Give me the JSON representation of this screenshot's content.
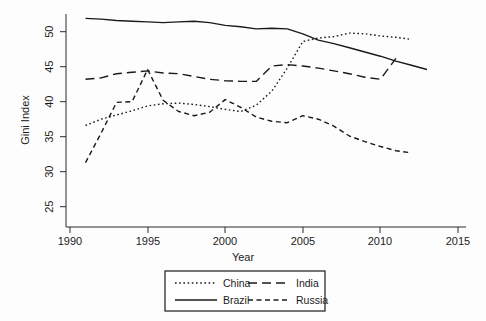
{
  "chart_data": {
    "type": "line",
    "title": "",
    "xlabel": "Year",
    "ylabel": "Gini Index",
    "xlim": [
      1990,
      2015
    ],
    "ylim": [
      25,
      52.5
    ],
    "xticks": [
      1990,
      1995,
      2000,
      2005,
      2010,
      2015
    ],
    "yticks": [
      25,
      30,
      35,
      40,
      45,
      50
    ],
    "grid": false,
    "legend_position": "below-axes",
    "series": [
      {
        "name": "China",
        "style": "dotted",
        "x": [
          1991,
          1992,
          1993,
          1994,
          1995,
          1996,
          1997,
          1998,
          1999,
          2000,
          2001,
          2002,
          2003,
          2004,
          2005,
          2006,
          2007,
          2008,
          2009,
          2010,
          2011,
          2012
        ],
        "values": [
          36.6,
          37.5,
          38.1,
          38.7,
          39.4,
          39.7,
          39.8,
          39.6,
          39.3,
          38.9,
          38.6,
          39.5,
          41.5,
          44.8,
          48.6,
          49.1,
          49.3,
          49.8,
          49.7,
          49.4,
          49.2,
          48.9
        ]
      },
      {
        "name": "Brazil",
        "style": "solid",
        "x": [
          1991,
          1992,
          1993,
          1994,
          1995,
          1996,
          1997,
          1998,
          1999,
          2000,
          2001,
          2002,
          2003,
          2004,
          2005,
          2006,
          2007,
          2008,
          2009,
          2010,
          2011,
          2012,
          2013
        ],
        "values": [
          51.9,
          51.8,
          51.6,
          51.5,
          51.4,
          51.3,
          51.4,
          51.5,
          51.3,
          50.9,
          50.7,
          50.4,
          50.5,
          50.4,
          49.7,
          48.8,
          48.3,
          47.7,
          47.1,
          46.5,
          45.8,
          45.2,
          44.6
        ]
      },
      {
        "name": "India",
        "style": "long-dash",
        "x": [
          1991,
          1992,
          1993,
          1994,
          1995,
          1996,
          1997,
          1998,
          1999,
          2000,
          2001,
          2002,
          2003,
          2004,
          2005,
          2006,
          2007,
          2008,
          2009,
          2010,
          2011
        ],
        "values": [
          43.2,
          43.4,
          44.0,
          44.2,
          44.4,
          44.1,
          44.0,
          43.6,
          43.2,
          43.0,
          42.9,
          42.9,
          45.1,
          45.3,
          45.1,
          44.8,
          44.4,
          44.0,
          43.5,
          43.2,
          46.2
        ]
      },
      {
        "name": "Russia",
        "style": "short-dash",
        "x": [
          1991,
          1992,
          1993,
          1994,
          1995,
          1996,
          1997,
          1998,
          1999,
          2000,
          2001,
          2002,
          2003,
          2004,
          2005,
          2006,
          2007,
          2008,
          2009,
          2010,
          2011,
          2012
        ],
        "values": [
          31.3,
          35.5,
          39.9,
          40.0,
          44.6,
          40.2,
          38.6,
          38.0,
          38.5,
          40.3,
          39.2,
          37.8,
          37.2,
          37.0,
          38.0,
          37.5,
          36.5,
          35.1,
          34.3,
          33.6,
          33.0,
          32.7
        ]
      }
    ]
  },
  "axes": {
    "y_title": "Gini Index",
    "x_title": "Year",
    "x_tick_labels": [
      "1990",
      "1995",
      "2000",
      "2005",
      "2010",
      "2015"
    ],
    "y_tick_labels": [
      "25",
      "30",
      "35",
      "40",
      "45",
      "50"
    ]
  },
  "legend": {
    "entries": [
      {
        "label": "China",
        "style": "dotted"
      },
      {
        "label": "India",
        "style": "long-dash"
      },
      {
        "label": "Brazil",
        "style": "solid"
      },
      {
        "label": "Russia",
        "style": "short-dash"
      }
    ]
  }
}
